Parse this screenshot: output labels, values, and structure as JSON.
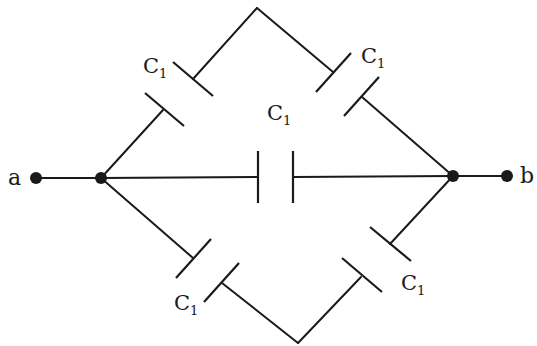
{
  "diagram": {
    "type": "capacitor-network",
    "terminals": [
      {
        "id": "a",
        "label": "a"
      },
      {
        "id": "b",
        "label": "b"
      }
    ],
    "capacitors": [
      {
        "id": "upper-left",
        "label": "C",
        "subscript": "1"
      },
      {
        "id": "upper-right",
        "label": "C",
        "subscript": "1"
      },
      {
        "id": "center",
        "label": "C",
        "subscript": "1"
      },
      {
        "id": "lower-left",
        "label": "C",
        "subscript": "1"
      },
      {
        "id": "lower-right",
        "label": "C",
        "subscript": "1"
      }
    ],
    "colors": {
      "line": "#1a1a1a",
      "background": "#ffffff"
    }
  }
}
